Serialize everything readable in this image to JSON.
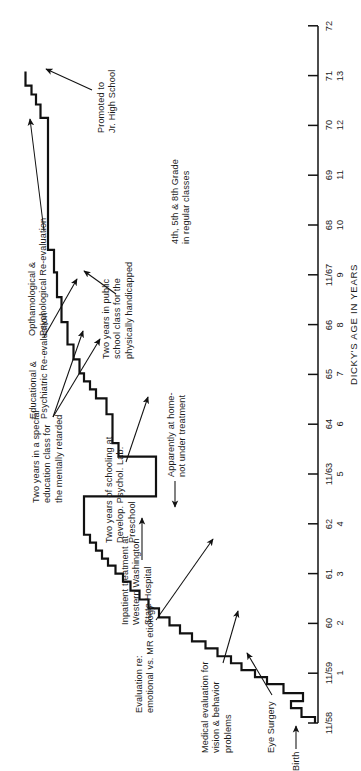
{
  "figure": {
    "axis_title": "DICKY'S AGE IN YEARS",
    "axis": {
      "date_ticks": [
        "11/58",
        "11/59",
        "60",
        "61",
        "62",
        "11/63",
        "64",
        "65",
        "66",
        "11/67",
        "68",
        "69",
        "70",
        "71",
        "72"
      ],
      "age_ticks": [
        "",
        "1",
        "2",
        "3",
        "4",
        "5",
        "6",
        "7",
        "8",
        "9",
        "10",
        "11",
        "12",
        "13",
        ""
      ]
    },
    "annotations": [
      {
        "id": "birth",
        "text": "Birth"
      },
      {
        "id": "eye-surgery",
        "text": "Eye Surgery"
      },
      {
        "id": "medical-eval",
        "text": "Medical evaluation for\nvision & behavior\nproblems"
      },
      {
        "id": "etiology-eval",
        "text": "Evaluation re:\nemotional vs. MR etiology"
      },
      {
        "id": "inpatient",
        "text": "Inpatient treatment at\nWestern Washington\nState Hospital"
      },
      {
        "id": "at-home",
        "text": "Apparently at home-\nnot under treatment"
      },
      {
        "id": "preschool",
        "text": "Two years of schooling at\nDevelop. Psychol. Lab.\nPreschool"
      },
      {
        "id": "special-ed",
        "text": "Two years in a special\neducation class for\nthe mentally retarded"
      },
      {
        "id": "educ-psych-eval",
        "text": "Educational &\nPsychiatric Re-evaluation"
      },
      {
        "id": "public-school",
        "text": "Two years in public\nschool class for the\nphysically handicapped"
      },
      {
        "id": "ophthal-eval",
        "text": "Opthamological &\nPsychological Re-evaluation"
      },
      {
        "id": "regular-classes",
        "text": "4th, 5th & 8th Grade\nin regular classes"
      },
      {
        "id": "promoted",
        "text": "Promoted to\nJr. High School"
      }
    ]
  },
  "chart_data": {
    "type": "line",
    "title": "",
    "xlabel": "DICKY'S AGE IN YEARS",
    "ylabel": "",
    "grid": false,
    "legend": "none",
    "note": "Cumulative step record of Dicky's case history plotted against age; x axis is dual-labelled with calendar date (11/58 .. 72) and age in years (1 .. 13).",
    "xlim": [
      0,
      14
    ],
    "ylim": [
      0,
      100
    ],
    "x_tick_positions": [
      0,
      1,
      2,
      3,
      4,
      5,
      6,
      7,
      8,
      9,
      10,
      11,
      12,
      13,
      14
    ],
    "x_tick_dates": [
      "11/58",
      "11/59",
      "60",
      "61",
      "62",
      "11/63",
      "64",
      "65",
      "66",
      "11/67",
      "68",
      "69",
      "70",
      "71",
      "72"
    ],
    "x_tick_ages": [
      "",
      "1",
      "2",
      "3",
      "4",
      "5",
      "6",
      "7",
      "8",
      "9",
      "10",
      "11",
      "12",
      "13",
      ""
    ],
    "series": [
      {
        "name": "cumulative record",
        "x": [
          0.0,
          0.12,
          0.12,
          0.3,
          0.3,
          0.44,
          0.44,
          0.6,
          0.6,
          0.78,
          0.78,
          0.92,
          0.92,
          1.06,
          1.06,
          1.2,
          1.2,
          1.34,
          1.34,
          1.5,
          1.5,
          1.64,
          1.64,
          1.8,
          1.8,
          1.96,
          1.96,
          2.12,
          2.12,
          2.3,
          2.3,
          2.48,
          2.48,
          2.66,
          2.66,
          2.84,
          2.84,
          3.0,
          3.0,
          3.16,
          3.16,
          3.3,
          3.3,
          3.46,
          3.46,
          3.62,
          3.62,
          3.78,
          3.78,
          4.55,
          4.55,
          5.35,
          5.35,
          5.62,
          5.62,
          6.2,
          6.2,
          6.52,
          6.52,
          6.7,
          6.7,
          6.86,
          6.86,
          7.02,
          7.02,
          7.3,
          7.3,
          7.6,
          7.6,
          8.05,
          8.05,
          8.55,
          8.55,
          9.05,
          9.05,
          9.5,
          9.5,
          12.15,
          12.15,
          12.42,
          12.42,
          12.62,
          12.62,
          12.8,
          12.8,
          13.08
        ],
        "y": [
          1.0,
          1.0,
          5.5,
          5.5,
          9.0,
          9.0,
          5.0,
          5.0,
          11.5,
          11.5,
          17.0,
          17.0,
          21.0,
          21.0,
          25.5,
          25.5,
          29.0,
          29.0,
          33.5,
          33.5,
          37.5,
          37.5,
          42.0,
          42.0,
          46.0,
          46.0,
          49.5,
          49.5,
          53.0,
          53.0,
          56.5,
          56.5,
          59.5,
          59.5,
          62.5,
          62.5,
          65.0,
          65.0,
          67.5,
          67.5,
          70.0,
          70.0,
          72.0,
          72.0,
          74.0,
          74.0,
          76.0,
          76.0,
          78.0,
          78.0,
          54.0,
          54.0,
          66.5,
          66.5,
          68.5,
          68.5,
          70.5,
          70.5,
          74.0,
          74.0,
          76.0,
          76.0,
          78.0,
          78.0,
          79.5,
          79.5,
          81.5,
          81.5,
          83.5,
          83.5,
          85.5,
          85.5,
          87.0,
          87.0,
          88.0,
          88.0,
          90.0,
          90.0,
          92.5,
          92.5,
          94.0,
          94.0,
          95.5,
          95.5,
          97.5,
          97.5
        ],
        "style": "step-post",
        "color": "#111111",
        "linewidth": 2.2
      }
    ]
  }
}
